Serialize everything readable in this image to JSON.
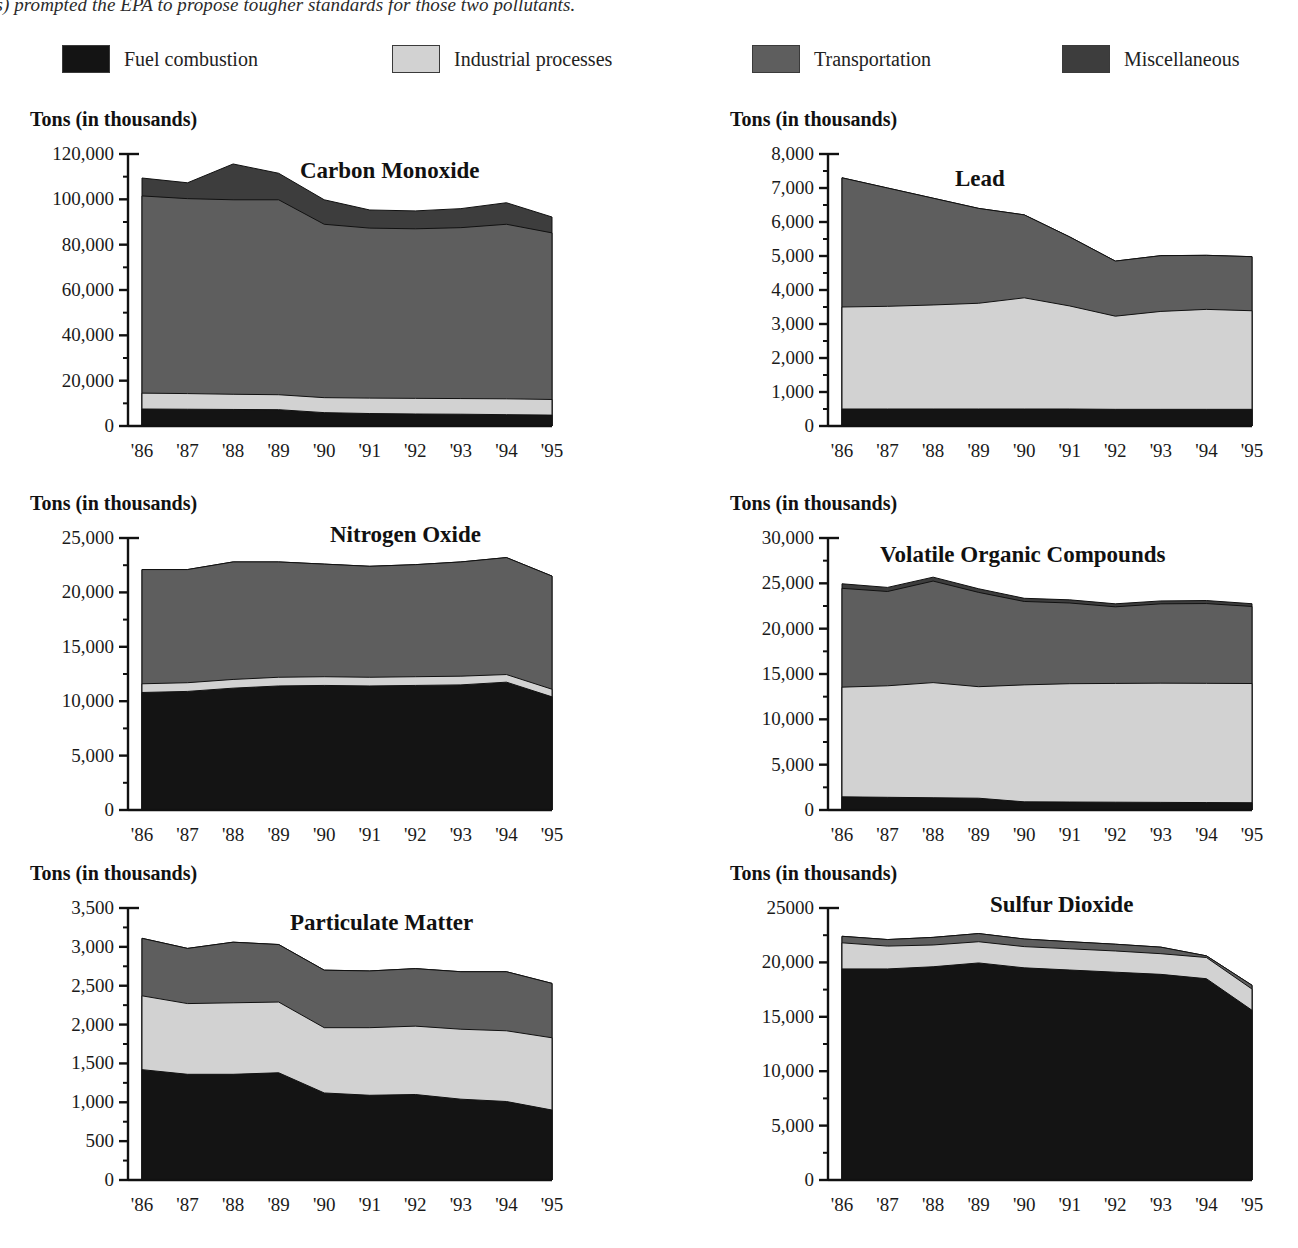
{
  "caption": {
    "text": "ompounds) prompted the EPA to propose tougher standards for those two pollutants."
  },
  "legend": {
    "items": [
      {
        "label": "Fuel combustion",
        "color": "#141414"
      },
      {
        "label": "Industrial processes",
        "color": "#d2d2d2"
      },
      {
        "label": "Transportation",
        "color": "#5e5e5e"
      },
      {
        "label": "Miscellaneous",
        "color": "#3d3d3d"
      }
    ]
  },
  "axis_caption": "Tons (in thousands)",
  "series_names": [
    "Fuel combustion",
    "Industrial processes",
    "Transportation",
    "Miscellaneous"
  ],
  "categories": [
    "'86",
    "'87",
    "'88",
    "'89",
    "'90",
    "'91",
    "'92",
    "'93",
    "'94",
    "'95"
  ],
  "chart_data": [
    {
      "type": "area",
      "stacked": true,
      "title": "Carbon Monoxide",
      "ylabel": "Tons (in thousands)",
      "xlabel": "",
      "ylim": [
        0,
        120000
      ],
      "yticks": [
        0,
        20000,
        40000,
        60000,
        80000,
        100000,
        120000
      ],
      "ytick_labels": [
        "0",
        "20,000",
        "40,000",
        "60,000",
        "80,000",
        "100,000",
        "120,000"
      ],
      "categories": [
        "'86",
        "'87",
        "'88",
        "'89",
        "'90",
        "'91",
        "'92",
        "'93",
        "'94",
        "'95"
      ],
      "grid": false,
      "legend_position": "top",
      "series": [
        {
          "name": "Fuel combustion",
          "values": [
            7500,
            7400,
            7300,
            7200,
            5900,
            5500,
            5300,
            5200,
            5000,
            4800
          ]
        },
        {
          "name": "Industrial processes",
          "values": [
            7000,
            6900,
            6700,
            6600,
            6600,
            6800,
            6900,
            6900,
            7000,
            6900
          ]
        },
        {
          "name": "Transportation",
          "values": [
            87000,
            86000,
            85800,
            86000,
            76500,
            75000,
            74800,
            75400,
            77000,
            73500
          ]
        },
        {
          "name": "Miscellaneous",
          "values": [
            7900,
            7000,
            15800,
            11700,
            10800,
            8000,
            7900,
            8400,
            9500,
            7000
          ]
        }
      ]
    },
    {
      "type": "area",
      "stacked": true,
      "title": "Lead",
      "ylabel": "Tons (in thousands)",
      "xlabel": "",
      "ylim": [
        0,
        8000
      ],
      "yticks": [
        0,
        1000,
        2000,
        3000,
        4000,
        5000,
        6000,
        7000,
        8000
      ],
      "ytick_labels": [
        "0",
        "1,000",
        "2,000",
        "3,000",
        "4,000",
        "5,000",
        "6,000",
        "7,000",
        "8,000"
      ],
      "categories": [
        "'86",
        "'87",
        "'88",
        "'89",
        "'90",
        "'91",
        "'92",
        "'93",
        "'94",
        "'95"
      ],
      "grid": false,
      "legend_position": "top",
      "series": [
        {
          "name": "Fuel combustion",
          "values": [
            500,
            500,
            500,
            500,
            500,
            500,
            490,
            490,
            490,
            490
          ]
        },
        {
          "name": "Industrial processes",
          "values": [
            3000,
            3020,
            3060,
            3110,
            3270,
            3030,
            2740,
            2880,
            2940,
            2900
          ]
        },
        {
          "name": "Transportation",
          "values": [
            3800,
            3480,
            3140,
            2790,
            2440,
            2030,
            1620,
            1640,
            1590,
            1590
          ]
        },
        {
          "name": "Miscellaneous",
          "values": [
            0,
            0,
            0,
            0,
            0,
            0,
            0,
            0,
            0,
            0
          ]
        }
      ]
    },
    {
      "type": "area",
      "stacked": true,
      "title": "Nitrogen Oxide",
      "ylabel": "Tons (in thousands)",
      "xlabel": "",
      "ylim": [
        0,
        25000
      ],
      "yticks": [
        0,
        5000,
        10000,
        15000,
        20000,
        25000
      ],
      "ytick_labels": [
        "0",
        "5,000",
        "10,000",
        "15,000",
        "20,000",
        "25,000"
      ],
      "categories": [
        "'86",
        "'87",
        "'88",
        "'89",
        "'90",
        "'91",
        "'92",
        "'93",
        "'94",
        "'95"
      ],
      "grid": false,
      "legend_position": "top",
      "series": [
        {
          "name": "Fuel combustion",
          "values": [
            10800,
            10900,
            11200,
            11400,
            11450,
            11400,
            11450,
            11500,
            11750,
            10400
          ]
        },
        {
          "name": "Industrial processes",
          "values": [
            800,
            800,
            800,
            800,
            800,
            800,
            800,
            800,
            700,
            700
          ]
        },
        {
          "name": "Transportation",
          "values": [
            10500,
            10400,
            10800,
            10600,
            10350,
            10200,
            10300,
            10500,
            10750,
            10400
          ]
        },
        {
          "name": "Miscellaneous",
          "values": [
            0,
            0,
            0,
            0,
            0,
            0,
            0,
            0,
            0,
            0
          ]
        }
      ]
    },
    {
      "type": "area",
      "stacked": true,
      "title": "Volatile Organic Compounds",
      "ylabel": "Tons (in thousands)",
      "xlabel": "",
      "ylim": [
        0,
        30000
      ],
      "yticks": [
        0,
        5000,
        10000,
        15000,
        20000,
        25000,
        30000
      ],
      "ytick_labels": [
        "0",
        "5,000",
        "10,000",
        "15,000",
        "20,000",
        "25,000",
        "30,000"
      ],
      "categories": [
        "'86",
        "'87",
        "'88",
        "'89",
        "'90",
        "'91",
        "'92",
        "'93",
        "'94",
        "'95"
      ],
      "grid": false,
      "legend_position": "top",
      "series": [
        {
          "name": "Fuel combustion",
          "values": [
            1450,
            1400,
            1350,
            1300,
            900,
            880,
            860,
            840,
            820,
            800
          ]
        },
        {
          "name": "Industrial processes",
          "values": [
            12100,
            12300,
            12700,
            12300,
            12900,
            13050,
            13100,
            13150,
            13150,
            13150
          ]
        },
        {
          "name": "Transportation",
          "values": [
            10900,
            10400,
            11200,
            10400,
            9200,
            8900,
            8450,
            8750,
            8800,
            8500
          ]
        },
        {
          "name": "Miscellaneous",
          "values": [
            500,
            450,
            430,
            400,
            350,
            350,
            330,
            320,
            330,
            300
          ]
        }
      ]
    },
    {
      "type": "area",
      "stacked": true,
      "title": "Particulate Matter",
      "ylabel": "Tons (in thousands)",
      "xlabel": "",
      "ylim": [
        0,
        3500
      ],
      "yticks": [
        0,
        500,
        1000,
        1500,
        2000,
        2500,
        3000,
        3500
      ],
      "ytick_labels": [
        "0",
        "500",
        "1,000",
        "1,500",
        "2,000",
        "2,500",
        "3,000",
        "3,500"
      ],
      "categories": [
        "'86",
        "'87",
        "'88",
        "'89",
        "'90",
        "'91",
        "'92",
        "'93",
        "'94",
        "'95"
      ],
      "grid": false,
      "legend_position": "top",
      "series": [
        {
          "name": "Fuel combustion",
          "values": [
            1420,
            1360,
            1360,
            1380,
            1120,
            1090,
            1100,
            1040,
            1010,
            900
          ]
        },
        {
          "name": "Industrial processes",
          "values": [
            950,
            910,
            920,
            910,
            840,
            870,
            880,
            900,
            910,
            930
          ]
        },
        {
          "name": "Transportation",
          "values": [
            740,
            710,
            780,
            740,
            740,
            730,
            740,
            740,
            760,
            700
          ]
        },
        {
          "name": "Miscellaneous",
          "values": [
            0,
            0,
            0,
            0,
            0,
            0,
            0,
            0,
            0,
            0
          ]
        }
      ]
    },
    {
      "type": "area",
      "stacked": true,
      "title": "Sulfur Dioxide",
      "ylabel": "Tons (in thousands)",
      "xlabel": "",
      "ylim": [
        0,
        25000
      ],
      "yticks": [
        0,
        5000,
        10000,
        15000,
        20000,
        25000
      ],
      "ytick_labels": [
        "0",
        "5,000",
        "10,000",
        "15,000",
        "20,000",
        "25000"
      ],
      "categories": [
        "'86",
        "'87",
        "'88",
        "'89",
        "'90",
        "'91",
        "'92",
        "'93",
        "'94",
        "'95"
      ],
      "grid": false,
      "legend_position": "top",
      "series": [
        {
          "name": "Fuel combustion",
          "values": [
            19400,
            19400,
            19600,
            19950,
            19500,
            19300,
            19100,
            18900,
            18500,
            15600
          ]
        },
        {
          "name": "Industrial processes",
          "values": [
            2400,
            2100,
            2000,
            1950,
            1950,
            1950,
            1950,
            1900,
            1950,
            1950
          ]
        },
        {
          "name": "Transportation",
          "values": [
            600,
            600,
            700,
            750,
            700,
            650,
            620,
            600,
            150,
            350
          ]
        },
        {
          "name": "Miscellaneous",
          "values": [
            0,
            0,
            0,
            0,
            0,
            0,
            0,
            0,
            0,
            0
          ]
        }
      ]
    }
  ],
  "panels": [
    {
      "id": "carbon-monoxide",
      "left": 0,
      "top": 108,
      "title_dx": 300,
      "title_dy": 50
    },
    {
      "id": "lead",
      "left": 700,
      "top": 108,
      "title_dx": 255,
      "title_dy": 58
    },
    {
      "id": "nitrogen-oxide",
      "left": 0,
      "top": 492,
      "title_dx": 330,
      "title_dy": 30
    },
    {
      "id": "voc",
      "left": 700,
      "top": 492,
      "title_dx": 180,
      "title_dy": 50
    },
    {
      "id": "particulate",
      "left": 0,
      "top": 862,
      "title_dx": 290,
      "title_dy": 48
    },
    {
      "id": "sulfur-dioxide",
      "left": 700,
      "top": 862,
      "title_dx": 290,
      "title_dy": 30
    }
  ]
}
